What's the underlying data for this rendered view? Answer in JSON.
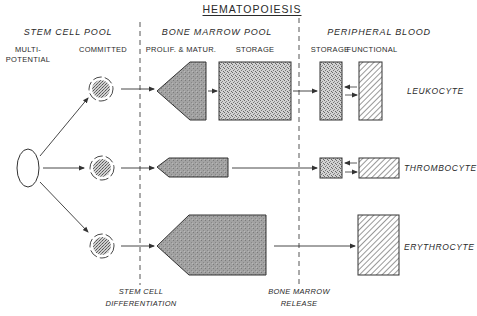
{
  "title": "HEMATOPOIESIS",
  "sections": {
    "stem_cell_pool": {
      "label": "STEM CELL POOL",
      "sub": [
        "MULTI-",
        "POTENTIAL",
        "COMMITTED"
      ]
    },
    "bone_marrow_pool": {
      "label": "BONE MARROW POOL",
      "sub": [
        "PROLIF. & MATUR.",
        "STORAGE"
      ]
    },
    "peripheral_blood": {
      "label": "PERIPHERAL BLOOD",
      "sub": [
        "STORAGE",
        "FUNCTIONAL"
      ]
    }
  },
  "cell_lines": [
    {
      "name": "LEUKOCYTE"
    },
    {
      "name": "THROMBOCYTE"
    },
    {
      "name": "ERYTHROCYTE"
    }
  ],
  "boundaries": {
    "stem_cell_differentiation": [
      "STEM CELL",
      "DIFFERENTIATION"
    ],
    "bone_marrow_release": [
      "BONE MARROW",
      "RELEASE"
    ]
  },
  "colors": {
    "line": "#333333",
    "prolif_fill": "#9a9a9a",
    "storage_fill": "#c4c4c4",
    "hatch": "#444444",
    "background": "#ffffff"
  }
}
